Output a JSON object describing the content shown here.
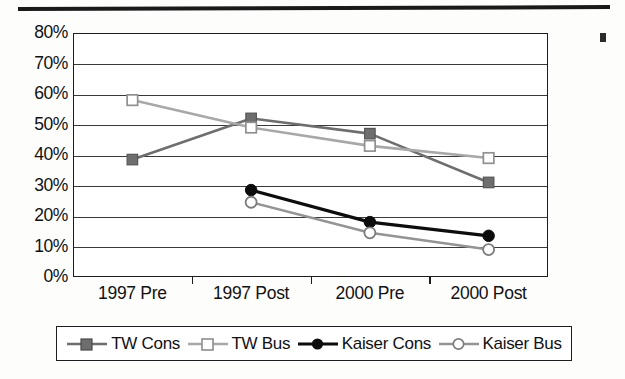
{
  "chart_data": {
    "type": "line",
    "title": "",
    "xlabel": "",
    "ylabel": "",
    "categories": [
      "1997 Pre",
      "1997 Post",
      "2000 Pre",
      "2000 Post"
    ],
    "ylim": [
      0,
      80
    ],
    "ytick_labels": [
      "80%",
      "70%",
      "60%",
      "50%",
      "40%",
      "30%",
      "20%",
      "10%",
      "0%"
    ],
    "ytick_values": [
      80,
      70,
      60,
      50,
      40,
      30,
      20,
      10,
      0
    ],
    "grid": true,
    "legend_position": "bottom",
    "series": [
      {
        "name": "TW Cons",
        "values": [
          38.5,
          52,
          47,
          31
        ],
        "color": "#6e6e6e",
        "marker": "filled-square"
      },
      {
        "name": "TW Bus",
        "values": [
          58,
          49,
          43,
          39
        ],
        "color": "#a8a8a8",
        "marker": "open-square"
      },
      {
        "name": "Kaiser Cons",
        "values": [
          null,
          28.5,
          18,
          13.5
        ],
        "color": "#0d0d0d",
        "marker": "filled-circle"
      },
      {
        "name": "Kaiser Bus",
        "values": [
          null,
          24.5,
          14.5,
          9
        ],
        "color": "#949494",
        "marker": "open-circle"
      }
    ]
  },
  "legend": {
    "entries": [
      {
        "label": "TW Cons"
      },
      {
        "label": "TW Bus"
      },
      {
        "label": "Kaiser Cons"
      },
      {
        "label": "Kaiser Bus"
      }
    ]
  },
  "colors": {
    "axis": "#1d1d1d",
    "grid": "#3a3a3a",
    "background": "#ffffff",
    "rule": "#1a1a1a"
  }
}
